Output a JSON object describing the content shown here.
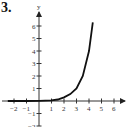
{
  "problem_number": "3.",
  "chart_data": {
    "type": "line",
    "title": "",
    "xlabel": "x",
    "ylabel": "y",
    "xlim": [
      -2.5,
      7
    ],
    "ylim": [
      -2,
      7
    ],
    "x_ticks": [
      "-2",
      "-1",
      "1",
      "2",
      "3",
      "4",
      "5",
      "6"
    ],
    "y_ticks": [
      "-2",
      "-1",
      "1",
      "2",
      "3",
      "4",
      "5",
      "6"
    ],
    "grid": false,
    "series": [
      {
        "name": "curve",
        "x": [
          -2.5,
          -1,
          0,
          1,
          1.5,
          2,
          2.5,
          3,
          3.5,
          4,
          4.3
        ],
        "values": [
          0.0,
          0.0,
          0.01,
          0.05,
          0.12,
          0.3,
          0.55,
          1.0,
          2.0,
          4.0,
          6.3
        ]
      }
    ]
  }
}
